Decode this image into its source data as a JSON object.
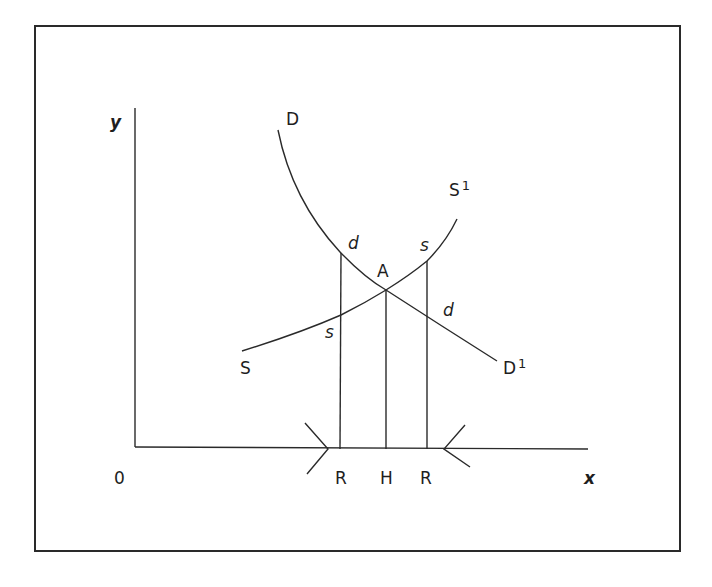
{
  "diagram": {
    "type": "supply-demand",
    "axes": {
      "y_label": "y",
      "x_label": "x",
      "origin_label": "0"
    },
    "curves": {
      "demand": {
        "start_label": "D",
        "end_label": "D",
        "end_superscript": "1"
      },
      "supply": {
        "start_label": "S",
        "end_label": "S",
        "end_superscript": "1"
      }
    },
    "equilibrium_label": "A",
    "point_labels": {
      "d_upper": "d",
      "s_upper": "s",
      "d_lower": "d",
      "s_lower": "s"
    },
    "x_markers": [
      "R",
      "H",
      "R"
    ],
    "colors": {
      "line": "#2a2a2a",
      "text": "#1e1e1e",
      "background": "#ffffff"
    }
  }
}
